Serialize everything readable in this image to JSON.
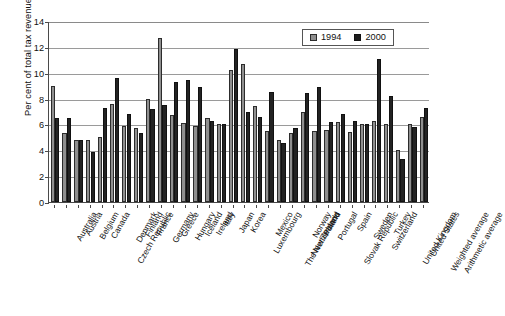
{
  "chart_data": {
    "type": "bar",
    "title": "",
    "xlabel": "",
    "ylabel": "Per cent of total tax revenue",
    "ylim": [
      0,
      14
    ],
    "yticks": [
      0,
      2,
      4,
      6,
      8,
      10,
      12,
      14
    ],
    "grid": true,
    "legend_position": "top-right",
    "categories": [
      "Australia",
      "Austria",
      "Belgium",
      "Canada",
      "Czech Republic",
      "Denmark",
      "Finland",
      "France",
      "Germany",
      "Greece",
      "Hungary",
      "Iceland",
      "Ireland",
      "Italy",
      "Japan",
      "Korea",
      "Luxembourg",
      "Mexico",
      "The Netherlands",
      "New Zealand",
      "Norway",
      "Poland",
      "Portugal",
      "Slovak Republic",
      "Spain",
      "Sweden",
      "Switzerland",
      "Turkey",
      "United Kingdom",
      "United States",
      "Weighted average",
      "Arithmetic average"
    ],
    "series": [
      {
        "name": "1994",
        "color": "#8f8f8f",
        "values": [
          9.0,
          5.3,
          4.8,
          4.8,
          5.0,
          7.6,
          5.9,
          5.7,
          8.0,
          12.7,
          6.7,
          6.1,
          5.9,
          6.5,
          6.0,
          10.2,
          10.7,
          7.4,
          5.5,
          4.8,
          5.3,
          7.0,
          5.5,
          5.6,
          6.2,
          5.4,
          6.0,
          6.3,
          6.0,
          4.0,
          6.0,
          6.6
        ]
      },
      {
        "name": "2000",
        "color": "#232323",
        "values": [
          6.5,
          6.5,
          4.8,
          3.9,
          7.3,
          9.6,
          6.8,
          5.3,
          7.2,
          7.5,
          9.3,
          9.4,
          8.9,
          6.3,
          6.0,
          11.8,
          7.0,
          6.6,
          8.5,
          4.6,
          5.7,
          8.4,
          8.9,
          6.2,
          6.8,
          6.3,
          6.0,
          11.1,
          8.2,
          3.3,
          5.8,
          7.3
        ]
      }
    ]
  },
  "legend": {
    "items": [
      {
        "label": "1994",
        "swatch": "s1994"
      },
      {
        "label": "2000",
        "swatch": "s2000"
      }
    ]
  }
}
